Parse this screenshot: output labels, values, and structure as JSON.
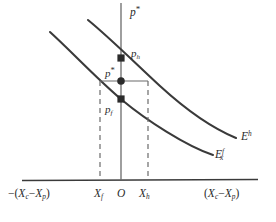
{
  "figure": {
    "type": "economics-diagram",
    "background_color": "#ffffff",
    "line_color": "#3a3a3a",
    "text_color": "#2b2b2b"
  },
  "axes": {
    "vertical": {
      "name": "price-axis",
      "label_parts": {
        "base": "p",
        "star": "*"
      },
      "label_text": "p*"
    },
    "horizontal": {
      "name": "quantity-axis",
      "left_label": {
        "minus": "−",
        "open": "(",
        "base1": "X",
        "sub1": "c",
        "dash": "−",
        "base2": "X",
        "sub2": "p",
        "close": ")",
        "text": "−(Xc−Xp)"
      },
      "right_label": {
        "open": "(",
        "base1": "X",
        "sub1": "c",
        "dash": "−",
        "base2": "X",
        "sub2": "p",
        "close": ")",
        "text": "(Xc−Xp)"
      }
    }
  },
  "ticks": [
    {
      "id": "tick-xf",
      "base": "X",
      "sub": "f",
      "text": "Xf"
    },
    {
      "id": "tick-origin",
      "base": "O",
      "sub": "",
      "text": "O"
    },
    {
      "id": "tick-xh",
      "base": "X",
      "sub": "h",
      "text": "Xh"
    }
  ],
  "points": [
    {
      "id": "point-ph",
      "marker": "square",
      "base": "p",
      "sub": "h",
      "star": "",
      "text": "ph"
    },
    {
      "id": "point-pstar",
      "marker": "circle",
      "base": "p",
      "sub": "",
      "star": "*",
      "text": "p*"
    },
    {
      "id": "point-pf",
      "marker": "square",
      "base": "p",
      "sub": "f",
      "star": "",
      "text": "pf"
    }
  ],
  "curves": [
    {
      "id": "curve-home",
      "label": {
        "base": "E",
        "sub": "",
        "sup": "h",
        "text": "E^h"
      },
      "style": "solid",
      "description": "home country excess demand schedule (upper curve)"
    },
    {
      "id": "curve-foreign",
      "label": {
        "base": "E",
        "sub": "x",
        "sup": "f",
        "text": "Ex^f"
      },
      "style": "solid",
      "description": "foreign country excess demand schedule (lower curve)"
    }
  ],
  "guides": [
    {
      "id": "guide-xf",
      "style": "dashed",
      "orientation": "vertical"
    },
    {
      "id": "guide-xh",
      "style": "dashed",
      "orientation": "vertical"
    },
    {
      "id": "guide-pstar",
      "style": "solid",
      "orientation": "horizontal"
    }
  ]
}
